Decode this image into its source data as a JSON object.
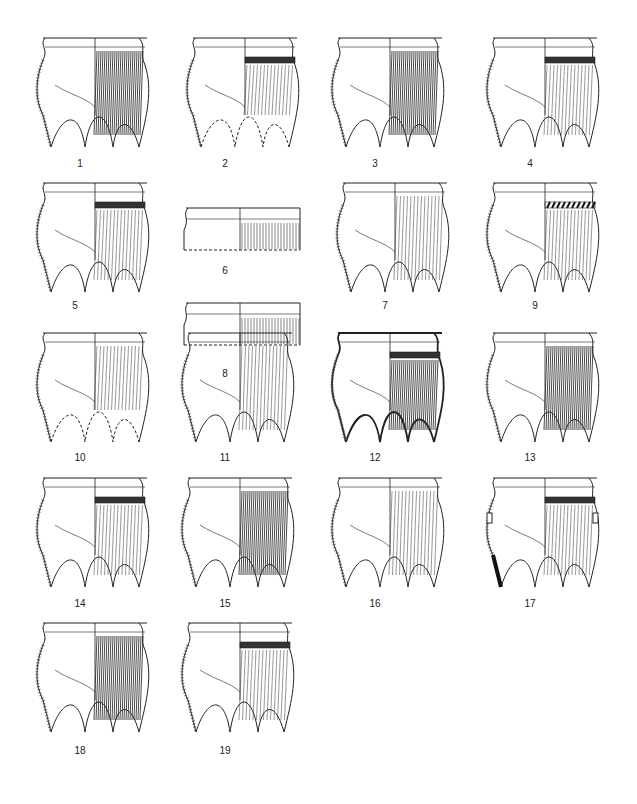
{
  "plate": {
    "figures": [
      {
        "label": "1",
        "type": "tripod",
        "decor": "dense-cord"
      },
      {
        "label": "2",
        "type": "tripod-reconstructed",
        "decor": "band-cord"
      },
      {
        "label": "3",
        "type": "tripod",
        "decor": "heavy-cord"
      },
      {
        "label": "4",
        "type": "tripod",
        "decor": "band-vertical"
      },
      {
        "label": "5",
        "type": "tripod",
        "decor": "bands-vertical"
      },
      {
        "label": "6",
        "type": "rim-fragment",
        "decor": "vertical"
      },
      {
        "label": "7",
        "type": "tripod",
        "decor": "light-cord"
      },
      {
        "label": "8",
        "type": "rim-fragment",
        "decor": "bands"
      },
      {
        "label": "9",
        "type": "tripod",
        "decor": "zigzag-band"
      },
      {
        "label": "10",
        "type": "tripod-reconstructed",
        "decor": "cord"
      },
      {
        "label": "11",
        "type": "tripod",
        "decor": "lines-vertical"
      },
      {
        "label": "12",
        "type": "tripod",
        "decor": "heavy-band"
      },
      {
        "label": "13",
        "type": "tripod",
        "decor": "dense-cord"
      },
      {
        "label": "14",
        "type": "tripod",
        "decor": "band-vertical"
      },
      {
        "label": "15",
        "type": "tripod",
        "decor": "dense-cord"
      },
      {
        "label": "16",
        "type": "tripod",
        "decor": "vertical"
      },
      {
        "label": "17",
        "type": "tripod-lugged",
        "decor": "bands-vertical"
      },
      {
        "label": "18",
        "type": "tripod",
        "decor": "dense-cord"
      },
      {
        "label": "19",
        "type": "tripod",
        "decor": "band-vertical"
      }
    ]
  }
}
